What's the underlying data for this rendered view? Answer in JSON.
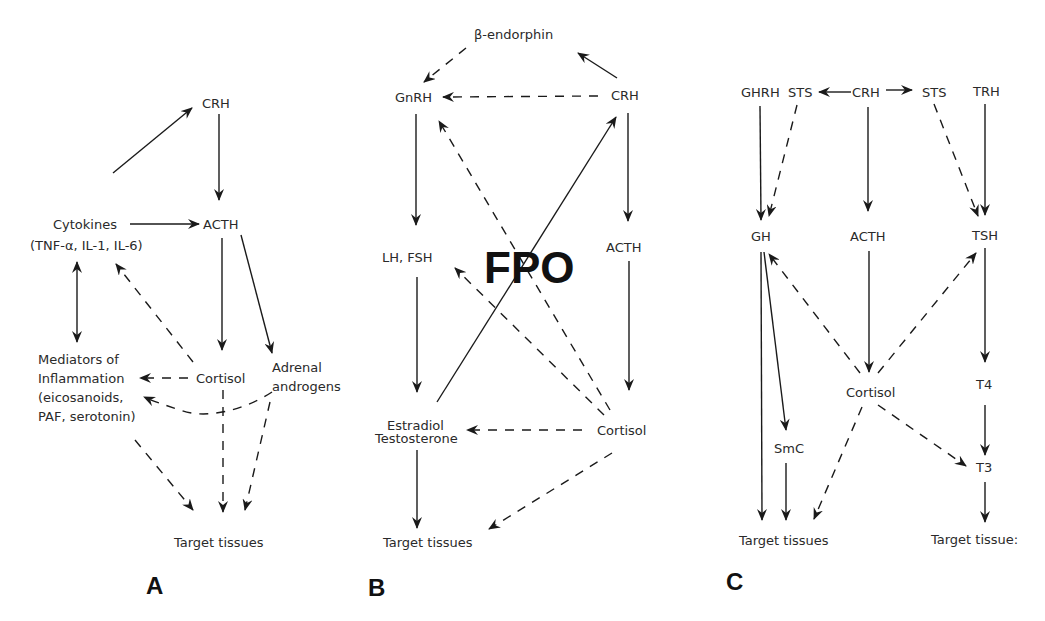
{
  "figure": {
    "overlay_text": "FPO",
    "panels": [
      {
        "id": "A",
        "label": "A",
        "nodes": {
          "crh": "CRH",
          "cytokines": "Cytokines",
          "cytokines_detail": "(TNF-α, IL-1, IL-6)",
          "acth": "ACTH",
          "mediators_1": "Mediators of",
          "mediators_2": "Inflammation",
          "mediators_3": "(eicosanoids,",
          "mediators_4": "PAF, serotonin)",
          "cortisol": "Cortisol",
          "adrenal_1": "Adrenal",
          "adrenal_2": "androgens",
          "target": "Target tissues"
        }
      },
      {
        "id": "B",
        "label": "B",
        "nodes": {
          "beta_endorphin": "β-endorphin",
          "gnrh": "GnRH",
          "crh": "CRH",
          "lh_fsh": "LH, FSH",
          "acth": "ACTH",
          "estradiol": "Estradiol",
          "testosterone": "Testosterone",
          "cortisol": "Cortisol",
          "target": "Target tissues"
        }
      },
      {
        "id": "C",
        "label": "C",
        "nodes": {
          "ghrh": "GHRH",
          "sts_left": "STS",
          "crh": "CRH",
          "sts_right": "STS",
          "trh": "TRH",
          "gh": "GH",
          "acth": "ACTH",
          "tsh": "TSH",
          "cortisol": "Cortisol",
          "t4": "T4",
          "smc": "SmC",
          "t3": "T3",
          "target_left": "Target tissues",
          "target_right": "Target tissue:"
        }
      }
    ]
  },
  "edges": [
    {
      "panel": "A",
      "from": "cytokines",
      "to": "crh",
      "style": "solid",
      "d": "M113,173 L192,108"
    },
    {
      "panel": "A",
      "from": "crh",
      "to": "acth",
      "style": "solid",
      "d": "M219,114 L219,200"
    },
    {
      "panel": "A",
      "from": "cytokines",
      "to": "acth",
      "style": "solid",
      "d": "M130,224 L199,224"
    },
    {
      "panel": "A",
      "from": "cytokines",
      "to": "mediators",
      "style": "solid-bidirectional",
      "d": "M77,262 L77,342"
    },
    {
      "panel": "A",
      "from": "acth",
      "to": "cortisol",
      "style": "solid",
      "d": "M222,238 L222,350"
    },
    {
      "panel": "A",
      "from": "acth",
      "to": "adrenal_androgens",
      "style": "solid",
      "d": "M241,235 L272,353"
    },
    {
      "panel": "A",
      "from": "cortisol",
      "to": "cytokines",
      "style": "dashed",
      "d": "M193,362 L116,264"
    },
    {
      "panel": "A",
      "from": "cortisol",
      "to": "mediators_1",
      "style": "dashed",
      "d": "M188,378 L140,378"
    },
    {
      "panel": "A",
      "from": "adrenal_androgens",
      "to": "mediators_2",
      "style": "dashed",
      "d": "M272,392 C245,410 205,420 180,410 C165,405 155,402 144,397"
    },
    {
      "panel": "A",
      "from": "cortisol",
      "to": "target",
      "style": "dashed",
      "d": "M223,390 L223,512"
    },
    {
      "panel": "A",
      "from": "mediators",
      "to": "target",
      "style": "dashed",
      "d": "M135,440 L193,510"
    },
    {
      "panel": "A",
      "from": "adrenal_androgens",
      "to": "target",
      "style": "dashed",
      "d": "M270,402 L245,510"
    },
    {
      "panel": "B",
      "from": "beta_endorphin",
      "to": "gnrh",
      "style": "dashed",
      "d": "M466,48 L424,82"
    },
    {
      "panel": "B",
      "from": "crh",
      "to": "beta_endorphin",
      "style": "solid",
      "d": "M617,78 L578,53"
    },
    {
      "panel": "B",
      "from": "crh",
      "to": "gnrh",
      "style": "dashed",
      "d": "M598,96 L443,97"
    },
    {
      "panel": "B",
      "from": "gnrh",
      "to": "lh_fsh",
      "style": "solid",
      "d": "M416,114 L416,225"
    },
    {
      "panel": "B",
      "from": "crh",
      "to": "acth",
      "style": "solid",
      "d": "M628,113 L628,221"
    },
    {
      "panel": "B",
      "from": "lh_fsh",
      "to": "estradiol",
      "style": "solid",
      "d": "M417,277 L417,392"
    },
    {
      "panel": "B",
      "from": "acth",
      "to": "cortisol",
      "style": "solid",
      "d": "M629,261 L629,390"
    },
    {
      "panel": "B",
      "from": "estradiol",
      "to": "crh",
      "style": "solid",
      "d": "M437,402 L616,117"
    },
    {
      "panel": "B",
      "from": "cortisol",
      "to": "gnrh",
      "style": "dashed",
      "d": "M610,410 L439,121"
    },
    {
      "panel": "B",
      "from": "cortisol",
      "to": "lh_fsh",
      "style": "dashed",
      "d": "M604,415 L455,268"
    },
    {
      "panel": "B",
      "from": "cortisol",
      "to": "estradiol",
      "style": "dashed",
      "d": "M582,430 L467,430"
    },
    {
      "panel": "B",
      "from": "estradiol",
      "to": "target",
      "style": "solid",
      "d": "M417,450 L417,528"
    },
    {
      "panel": "B",
      "from": "cortisol",
      "to": "target",
      "style": "dashed",
      "d": "M612,453 L489,529"
    },
    {
      "panel": "C",
      "from": "crh",
      "to": "sts_left",
      "style": "solid",
      "d": "M851,92 L819,92"
    },
    {
      "panel": "C",
      "from": "crh",
      "to": "sts_right",
      "style": "solid",
      "d": "M886,90 L912,90"
    },
    {
      "panel": "C",
      "from": "ghrh",
      "to": "gh",
      "style": "solid",
      "d": "M760,106 L761,220"
    },
    {
      "panel": "C",
      "from": "sts_left",
      "to": "gh",
      "style": "dashed",
      "d": "M797,105 L769,216"
    },
    {
      "panel": "C",
      "from": "crh",
      "to": "acth",
      "style": "solid",
      "d": "M868,107 L868,211"
    },
    {
      "panel": "C",
      "from": "sts_right",
      "to": "tsh",
      "style": "dashed",
      "d": "M934,104 L978,216"
    },
    {
      "panel": "C",
      "from": "trh",
      "to": "tsh",
      "style": "solid",
      "d": "M985,104 L985,215"
    },
    {
      "panel": "C",
      "from": "gh",
      "to": "target_left",
      "style": "solid",
      "d": "M761,252 L762,520"
    },
    {
      "panel": "C",
      "from": "gh",
      "to": "smc",
      "style": "solid",
      "d": "M764,252 L786,430"
    },
    {
      "panel": "C",
      "from": "acth",
      "to": "cortisol",
      "style": "solid",
      "d": "M869,251 L869,372"
    },
    {
      "panel": "C",
      "from": "cortisol",
      "to": "gh",
      "style": "dashed",
      "d": "M860,373 L769,254"
    },
    {
      "panel": "C",
      "from": "cortisol",
      "to": "tsh",
      "style": "dashed",
      "d": "M878,373 L976,253"
    },
    {
      "panel": "C",
      "from": "tsh",
      "to": "t4",
      "style": "solid",
      "d": "M985,248 L985,362"
    },
    {
      "panel": "C",
      "from": "cortisol",
      "to": "target_left",
      "style": "dashed",
      "d": "M862,407 L814,519"
    },
    {
      "panel": "C",
      "from": "cortisol",
      "to": "t3",
      "style": "dashed",
      "d": "M878,405 L966,466"
    },
    {
      "panel": "C",
      "from": "t4",
      "to": "t3",
      "style": "solid",
      "d": "M985,405 L985,455"
    },
    {
      "panel": "C",
      "from": "smc",
      "to": "target_left",
      "style": "solid",
      "d": "M786,463 L786,520"
    },
    {
      "panel": "C",
      "from": "t3",
      "to": "target_right",
      "style": "solid",
      "d": "M985,482 L985,522"
    }
  ]
}
